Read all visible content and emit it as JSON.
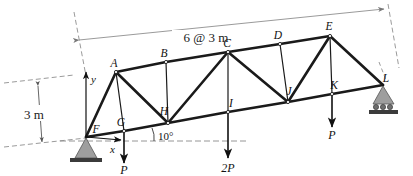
{
  "figure": {
    "type": "truss-free-body-diagram",
    "background_color": "#ffffff",
    "member_color": "#1a1a1a",
    "dimension_color": "#8a8a8a",
    "support_fill": "#9e9e9e"
  },
  "dimensions": {
    "span_label": "6 @ 3 m",
    "height_label": "3 m",
    "angle_label": "10°"
  },
  "axes": {
    "x_label": "x",
    "y_label": "y"
  },
  "joints": [
    {
      "id": "A",
      "label": "A",
      "x": 116,
      "y": 72,
      "label_dx": -2,
      "label_dy": -5,
      "chord": "top"
    },
    {
      "id": "B",
      "label": "B",
      "x": 166,
      "y": 62,
      "label_dx": -2,
      "label_dy": -5,
      "chord": "top"
    },
    {
      "id": "C",
      "label": "C",
      "x": 228,
      "y": 52,
      "label_dx": -1,
      "label_dy": -5,
      "chord": "top"
    },
    {
      "id": "D",
      "label": "D",
      "x": 280,
      "y": 44,
      "label_dx": -2,
      "label_dy": -5,
      "chord": "top"
    },
    {
      "id": "E",
      "label": "E",
      "x": 330,
      "y": 36,
      "label_dx": -1,
      "label_dy": -6,
      "chord": "top"
    },
    {
      "id": "F",
      "label": "F",
      "x": 86,
      "y": 137,
      "label_dx": 10,
      "label_dy": -4,
      "chord": "bottom"
    },
    {
      "id": "G",
      "label": "G",
      "x": 124,
      "y": 131,
      "label_dx": -3,
      "label_dy": -5,
      "chord": "bottom"
    },
    {
      "id": "H",
      "label": "H",
      "x": 168,
      "y": 123,
      "label_dx": -4,
      "label_dy": -8,
      "chord": "bottom"
    },
    {
      "id": "I",
      "label": "I",
      "x": 228,
      "y": 112,
      "label_dx": 3,
      "label_dy": -5,
      "chord": "bottom"
    },
    {
      "id": "J",
      "label": "J",
      "x": 288,
      "y": 102,
      "label_dx": 1,
      "label_dy": -7,
      "chord": "bottom"
    },
    {
      "id": "K",
      "label": "K",
      "x": 332,
      "y": 94,
      "label_dx": 2,
      "label_dy": -5,
      "chord": "bottom"
    },
    {
      "id": "L",
      "label": "L",
      "x": 383,
      "y": 85,
      "label_dx": 3,
      "label_dy": -3,
      "chord": "bottom"
    }
  ],
  "members": [
    {
      "from": "F",
      "to": "A",
      "weight": "heavy"
    },
    {
      "from": "A",
      "to": "B",
      "weight": "heavy"
    },
    {
      "from": "B",
      "to": "C",
      "weight": "heavy"
    },
    {
      "from": "C",
      "to": "D",
      "weight": "heavy"
    },
    {
      "from": "D",
      "to": "E",
      "weight": "heavy"
    },
    {
      "from": "E",
      "to": "L",
      "weight": "heavy"
    },
    {
      "from": "F",
      "to": "G",
      "weight": "heavy"
    },
    {
      "from": "G",
      "to": "H",
      "weight": "heavy"
    },
    {
      "from": "H",
      "to": "I",
      "weight": "heavy"
    },
    {
      "from": "I",
      "to": "J",
      "weight": "heavy"
    },
    {
      "from": "J",
      "to": "K",
      "weight": "heavy"
    },
    {
      "from": "K",
      "to": "L",
      "weight": "heavy"
    },
    {
      "from": "A",
      "to": "G",
      "weight": "light"
    },
    {
      "from": "A",
      "to": "H",
      "weight": "heavy"
    },
    {
      "from": "B",
      "to": "H",
      "weight": "light"
    },
    {
      "from": "C",
      "to": "H",
      "weight": "heavy"
    },
    {
      "from": "C",
      "to": "I",
      "weight": "light"
    },
    {
      "from": "C",
      "to": "J",
      "weight": "heavy"
    },
    {
      "from": "D",
      "to": "J",
      "weight": "light"
    },
    {
      "from": "E",
      "to": "J",
      "weight": "heavy"
    },
    {
      "from": "E",
      "to": "K",
      "weight": "light"
    }
  ],
  "loads": [
    {
      "id": "load-G",
      "label": "P",
      "joint": "G",
      "x": 124,
      "tip_y": 163,
      "label_y": 174
    },
    {
      "id": "load-I",
      "label": "2P",
      "joint": "I",
      "x": 228,
      "tip_y": 158,
      "label_y": 172
    },
    {
      "id": "load-K",
      "label": "P",
      "joint": "K",
      "x": 332,
      "tip_y": 127,
      "label_y": 139
    }
  ],
  "supports": [
    {
      "id": "support-F",
      "type": "pin",
      "joint": "F",
      "x": 86,
      "y": 137
    },
    {
      "id": "support-L",
      "type": "roller",
      "joint": "L",
      "x": 383,
      "y": 85
    }
  ]
}
